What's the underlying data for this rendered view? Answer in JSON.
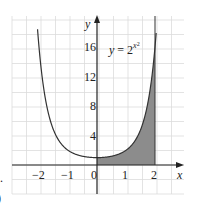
{
  "chart_data": {
    "type": "area",
    "title": "",
    "function_label": "y = 2^{x^2}",
    "function_label_base": "y = 2",
    "function_label_exp": "x²",
    "xlabel": "x",
    "ylabel": "y",
    "xlim": [
      -2.9,
      2.9
    ],
    "ylim": [
      -4,
      20
    ],
    "x_ticks": [
      "−2",
      "−1",
      "0",
      "1",
      "2"
    ],
    "x_tick_values": [
      -2,
      -1,
      0,
      1,
      2
    ],
    "y_ticks": [
      "4",
      "8",
      "12",
      "16"
    ],
    "y_tick_values": [
      4,
      8,
      12,
      16
    ],
    "grid": true,
    "series": [
      {
        "name": "y = 2^(x^2)",
        "x": [
          -2,
          -1.5,
          -1,
          -0.5,
          0,
          0.5,
          1,
          1.5,
          2
        ],
        "values": [
          16,
          4.76,
          2,
          1.19,
          1,
          1.19,
          2,
          4.76,
          16
        ]
      }
    ],
    "shaded_region": {
      "from_x": 0,
      "to_x": 2,
      "under": "y = 2^(x^2)",
      "color": "#8c8c8c"
    },
    "colors": {
      "curve": "#333333",
      "shade": "#8c8c8c",
      "grid": "#dcdcdc",
      "axes": "#222222"
    }
  },
  "margin_marks": {
    "left_dot": ".",
    "left_paren": ")"
  }
}
